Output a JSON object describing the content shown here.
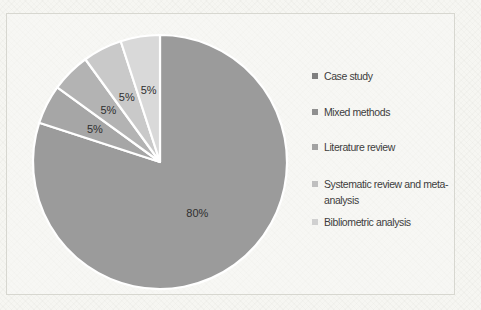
{
  "chart_data": {
    "type": "pie",
    "title": "",
    "categories": [
      "Case study",
      "Mixed methods",
      "Literature review",
      "Systematic review and meta-analysis",
      "Bibliometric analysis"
    ],
    "values": [
      80,
      5,
      5,
      5,
      5
    ],
    "labels": [
      "80%",
      "5%",
      "5%",
      "5%",
      "5%"
    ],
    "units": "%",
    "colors": [
      "#9b9b9b",
      "#a6a6a6",
      "#b3b3b3",
      "#c9c9c9",
      "#d9d9d9"
    ],
    "marker_colors": [
      "#7f7f7f",
      "#8f8f8f",
      "#a2a2a2",
      "#bfbfbf",
      "#d0d0d0"
    ],
    "divider_color": "#ffffff",
    "label_color": "#2f2f2f",
    "legend_position": "right",
    "start_angle_deg": 0,
    "direction": "clockwise",
    "legend": {
      "items": [
        {
          "label": "Case study"
        },
        {
          "label": "Mixed methods"
        },
        {
          "label": "Literature review"
        },
        {
          "label": "Systematic review and meta-analysis"
        },
        {
          "label": "Bibliometric analysis"
        }
      ]
    }
  }
}
